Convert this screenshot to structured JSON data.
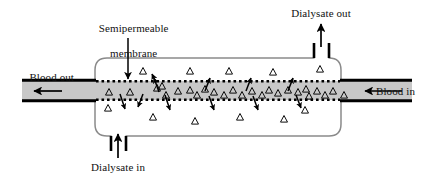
{
  "figure": {
    "labels": {
      "membrane_line1": "Semipermeable",
      "membrane_line2": "membrane",
      "dialysate_out": "Dialysate out",
      "dialysate_in": "Dialysate in",
      "blood_out": "Blood out",
      "blood_in": "Blood in"
    },
    "colors": {
      "stroke": "#000000",
      "blood_channel_fill": "#c8c8c8",
      "casing_stroke": "#7a7a7a",
      "background": "#ffffff",
      "text": "#111111"
    },
    "geometry": {
      "canvas_width": 428,
      "canvas_height": 185,
      "channel_top_y": 81,
      "channel_bottom_y": 100,
      "channel_left_x": 22,
      "channel_right_x": 412,
      "casing_left_x": 95,
      "casing_right_x": 341,
      "casing_top_y": 58,
      "casing_bottom_y": 136
    },
    "solutes": {
      "glyph": "triangle-outline",
      "inside_channel_count": 24,
      "above_membrane_count": 6,
      "below_membrane_count": 6
    },
    "flow_arrows": {
      "blood_direction": "right-to-left",
      "dialysate_direction": "bottom-left-to-top-right",
      "transport_up_count": 5,
      "transport_down_count": 6
    }
  }
}
